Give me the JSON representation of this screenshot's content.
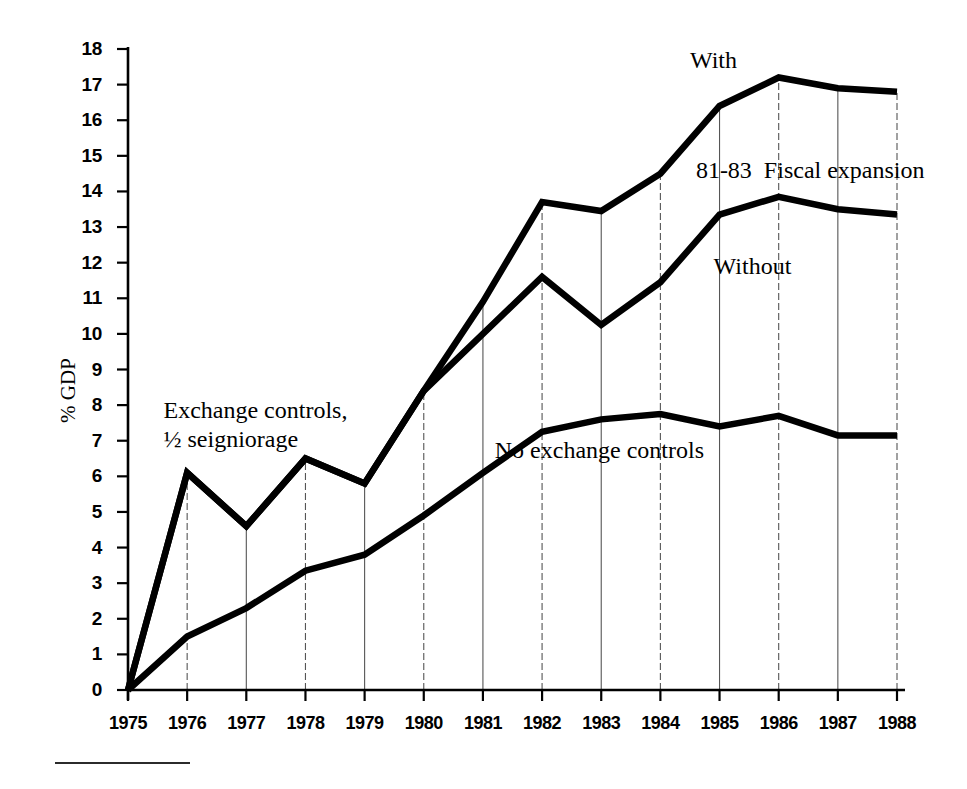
{
  "chart_data": {
    "type": "line",
    "title": "",
    "xlabel": "",
    "ylabel": "% GDP",
    "categories": [
      "1975",
      "1976",
      "1977",
      "1978",
      "1979",
      "1980",
      "1981",
      "1982",
      "1983",
      "1984",
      "1985",
      "1986",
      "1987",
      "1988"
    ],
    "x": [
      1975,
      1976,
      1977,
      1978,
      1979,
      1980,
      1981,
      1982,
      1983,
      1984,
      1985,
      1986,
      1987,
      1988
    ],
    "xlim": [
      1975,
      1988
    ],
    "ylim": [
      0,
      18
    ],
    "yticks": [
      0,
      1,
      2,
      3,
      4,
      5,
      6,
      7,
      8,
      9,
      10,
      11,
      12,
      13,
      14,
      15,
      16,
      17,
      18
    ],
    "grid": "vertical-only",
    "legend_position": "inline-annotations",
    "series": [
      {
        "name": "With",
        "label": "With",
        "color": "#000000",
        "values": [
          0,
          6.1,
          4.6,
          6.5,
          5.8,
          8.4,
          10.9,
          13.7,
          13.45,
          14.5,
          16.4,
          17.2,
          16.9,
          16.8
        ]
      },
      {
        "name": "Without",
        "label": "Without",
        "color": "#000000",
        "values": [
          0,
          6.1,
          4.6,
          6.5,
          5.8,
          8.4,
          10.0,
          11.6,
          10.25,
          11.45,
          13.35,
          13.85,
          13.5,
          13.35
        ]
      },
      {
        "name": "No exchange controls",
        "label": "No exchange controls",
        "color": "#000000",
        "values": [
          0,
          1.5,
          2.3,
          3.35,
          3.8,
          4.9,
          6.1,
          7.25,
          7.6,
          7.75,
          7.4,
          7.7,
          7.15,
          7.15
        ]
      }
    ],
    "annotations": [
      {
        "id": "exchange-controls",
        "text": "Exchange controls,\n½ seigniorage",
        "x": 1975.6,
        "y": 7.85
      },
      {
        "id": "with",
        "text": "With",
        "x": 1984.5,
        "y": 17.7
      },
      {
        "id": "fiscal-expansion",
        "text": "81-83  Fiscal expansion",
        "x": 1984.6,
        "y": 14.6
      },
      {
        "id": "without",
        "text": "Without",
        "x": 1984.9,
        "y": 11.9
      },
      {
        "id": "no-exchange-controls",
        "text": "No exchange controls",
        "x": 1981.2,
        "y": 6.75
      }
    ]
  },
  "axis": {
    "ytick_labels": [
      "18",
      "17",
      "16",
      "15",
      "14",
      "13",
      "12",
      "11",
      "10",
      "9",
      "8",
      "7",
      "6",
      "5",
      "4",
      "3",
      "2",
      "1",
      "0"
    ],
    "xtick_labels": [
      "1975",
      "1976",
      "1977",
      "1978",
      "1979",
      "1980",
      "1981",
      "1982",
      "1983",
      "1984",
      "1985",
      "1986",
      "1987",
      "1988"
    ],
    "ylabel_text": "% GDP"
  },
  "annotations_text": {
    "exchange_controls": "Exchange controls,\n½ seigniorage",
    "with": "With",
    "fiscal_expansion": "81-83  Fiscal expansion",
    "without": "Without",
    "no_exchange_controls": "No exchange controls"
  },
  "colors": {
    "ink": "#000000",
    "gridline": "#555555",
    "background": "#ffffff"
  }
}
